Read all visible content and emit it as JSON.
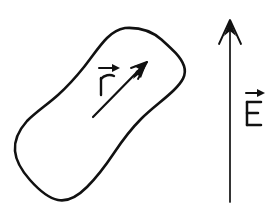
{
  "figure": {
    "kind": "hand-drawn-physics-diagram",
    "background_color": "#ffffff",
    "ink_color": "#111111",
    "width": 274,
    "height": 210
  },
  "shapes": {
    "blob": {
      "name": "irregular closed blob outline",
      "description": "hand-drawn peanut / hourglass shaped closed curve tilted from lower-left to upper-right",
      "stroke_width": 2.4
    }
  },
  "vectors": [
    {
      "id": "r",
      "label": "r",
      "label_accent": "vector-arrow",
      "description": "position vector drawn inside the blob pointing up and to the right",
      "tail": {
        "x": 93,
        "y": 117
      },
      "tip": {
        "x": 147,
        "y": 62
      },
      "label_position": {
        "x": 103,
        "y": 78
      },
      "stroke_width": 2.2
    },
    {
      "id": "E",
      "label": "E",
      "label_accent": "vector-arrow",
      "description": "uniform electric field vector pointing straight up at the right of the figure",
      "tail": {
        "x": 230,
        "y": 202
      },
      "tip": {
        "x": 230,
        "y": 20
      },
      "label_position": {
        "x": 253,
        "y": 108
      },
      "stroke_width": 1.8
    }
  ],
  "labels": {
    "r_vector": "r",
    "e_vector": "E"
  }
}
